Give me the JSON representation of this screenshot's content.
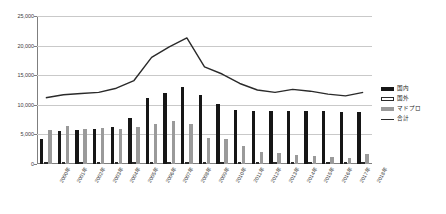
{
  "chart_data": {
    "type": "bar",
    "title": "",
    "subtitle": "",
    "xlabel": "",
    "ylabel": "",
    "grid": true,
    "legend_position": "right",
    "ylim": [
      0,
      25000
    ],
    "yticks": [
      0,
      5000,
      10000,
      15000,
      20000,
      25000
    ],
    "ytick_labels": [
      "0",
      "5,000",
      "10,000",
      "15,000",
      "20,000",
      "25,000"
    ],
    "categories": [
      "2000年",
      "2001年",
      "2002年",
      "2003年",
      "2004年",
      "2005年",
      "2006年",
      "2007年",
      "2008年",
      "2009年",
      "2010年",
      "2011年",
      "2012年",
      "2013年",
      "2014年",
      "2015年",
      "2016年",
      "2017年",
      "2018年"
    ],
    "series": [
      {
        "name": "国内",
        "kind": "bar",
        "color": "#161616",
        "values": [
          4200,
          5600,
          5700,
          5900,
          6300,
          7700,
          11200,
          12000,
          13000,
          11600,
          10200,
          9100,
          9000,
          9000,
          9000,
          9000,
          8900,
          8800,
          8800
        ]
      },
      {
        "name": "国外",
        "kind": "bar",
        "color": "#ffffff",
        "values": [
          400,
          350,
          350,
          400,
          400,
          400,
          400,
          400,
          400,
          400,
          350,
          350,
          350,
          350,
          350,
          350,
          350,
          350,
          350
        ]
      },
      {
        "name": "マドプロ",
        "kind": "bar",
        "color": "#9a9a9a",
        "values": [
          5700,
          6400,
          5900,
          6100,
          5900,
          6300,
          6800,
          7200,
          6800,
          4400,
          4200,
          3100,
          2100,
          1800,
          1500,
          1300,
          1200,
          1100,
          1700
        ]
      },
      {
        "name": "合計",
        "kind": "line",
        "color": "#2a2a2a",
        "values": [
          11200,
          11700,
          11900,
          12100,
          12800,
          14100,
          18000,
          19800,
          21300,
          16400,
          15200,
          13600,
          12500,
          12100,
          12600,
          12300,
          11800,
          11500,
          12100
        ]
      }
    ],
    "legend": [
      {
        "label": "国内",
        "swatch": "filled-black"
      },
      {
        "label": "国外",
        "swatch": "outline-white"
      },
      {
        "label": "マドプロ",
        "swatch": "filled-gray"
      },
      {
        "label": "合計",
        "swatch": "line"
      }
    ]
  }
}
